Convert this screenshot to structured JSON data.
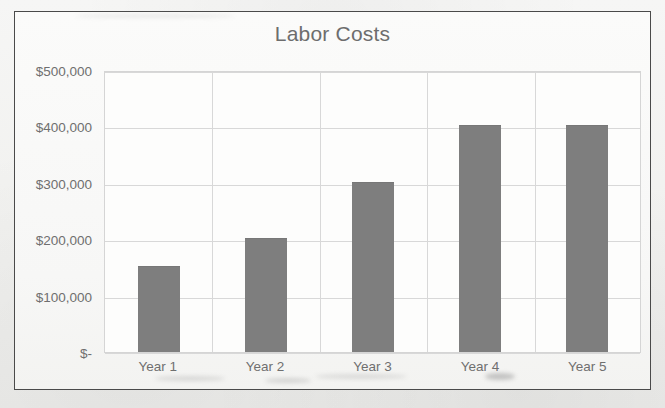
{
  "chart_data": {
    "type": "bar",
    "title": "Labor Costs",
    "categories": [
      "Year 1",
      "Year 2",
      "Year 3",
      "Year 4",
      "Year 5"
    ],
    "values": [
      150000,
      200000,
      300000,
      400000,
      400000
    ],
    "xlabel": "",
    "ylabel": "",
    "ylim": [
      0,
      500000
    ],
    "ytick_values": [
      500000,
      400000,
      300000,
      200000,
      100000,
      0
    ],
    "ytick_labels": [
      "$500,000",
      "$400,000",
      "$300,000",
      "$200,000",
      "$100,000",
      "$-"
    ],
    "grid": true,
    "legend": false,
    "series": [
      {
        "name": "Labor Costs",
        "values": [
          150000,
          200000,
          300000,
          400000,
          400000
        ],
        "color": "#7e7e7e"
      }
    ],
    "colors": {
      "bar_fill": "#7e7e7e",
      "gridline": "#d8d8d8",
      "axis_text": "#6f6f6f",
      "title_text": "#6d6d6d",
      "plot_background": "#fdfdfc",
      "chart_border": "#4a4a4a"
    }
  }
}
